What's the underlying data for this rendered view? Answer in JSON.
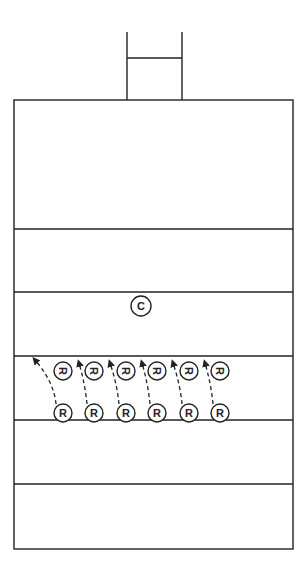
{
  "diagram": {
    "type": "rugby-field-drill",
    "colors": {
      "line": "#222222",
      "background": "#ffffff"
    },
    "field": {
      "x": 14,
      "y": 100,
      "width": 279,
      "height": 449
    },
    "goalposts": {
      "left_x": 127,
      "right_x": 182,
      "top_y": 32,
      "crossbar_y": 58,
      "base_y": 100
    },
    "field_lines_y": [
      229,
      292,
      356,
      420,
      484
    ],
    "coach": {
      "label": "C",
      "x": 141,
      "y": 306
    },
    "players_back": [
      {
        "label": "R",
        "x": 63,
        "y": 371,
        "rotated": true
      },
      {
        "label": "R",
        "x": 94,
        "y": 371,
        "rotated": true
      },
      {
        "label": "R",
        "x": 126,
        "y": 371,
        "rotated": true
      },
      {
        "label": "R",
        "x": 157,
        "y": 371,
        "rotated": true
      },
      {
        "label": "R",
        "x": 189,
        "y": 371,
        "rotated": true
      },
      {
        "label": "R",
        "x": 220,
        "y": 371,
        "rotated": true
      }
    ],
    "players_front": [
      {
        "label": "R",
        "x": 63,
        "y": 413
      },
      {
        "label": "R",
        "x": 94,
        "y": 413
      },
      {
        "label": "R",
        "x": 126,
        "y": 413
      },
      {
        "label": "R",
        "x": 157,
        "y": 413
      },
      {
        "label": "R",
        "x": 189,
        "y": 413
      },
      {
        "label": "R",
        "x": 220,
        "y": 413
      }
    ],
    "runs": [
      {
        "from": [
          56,
          404
        ],
        "to": [
          35,
          360
        ]
      },
      {
        "from": [
          87,
          404
        ],
        "to": [
          79,
          363
        ]
      },
      {
        "from": [
          119,
          404
        ],
        "to": [
          110,
          363
        ]
      },
      {
        "from": [
          150,
          404
        ],
        "to": [
          142,
          363
        ]
      },
      {
        "from": [
          182,
          404
        ],
        "to": [
          173,
          363
        ]
      },
      {
        "from": [
          213,
          404
        ],
        "to": [
          205,
          363
        ]
      }
    ]
  }
}
